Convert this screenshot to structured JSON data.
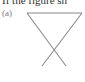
{
  "page": {
    "header_text": "If the figure sh",
    "figure_label": "(a)"
  },
  "figure": {
    "stroke_color": "#8a8a8a",
    "top_bar": {
      "x1": 27,
      "y1": 13,
      "x2": 82,
      "y2": 13
    },
    "line_left": {
      "x1": 27,
      "y1": 13,
      "x2": 66,
      "y2": 66
    },
    "line_right": {
      "x1": 82,
      "y1": 13,
      "x2": 42,
      "y2": 66
    }
  }
}
